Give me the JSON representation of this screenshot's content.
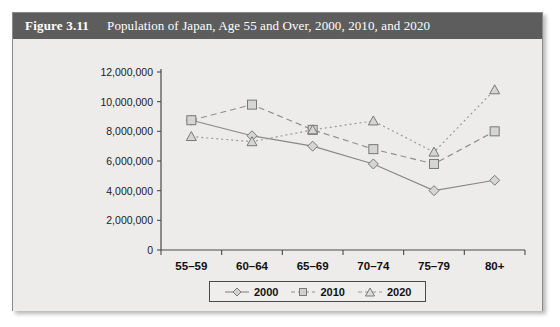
{
  "figure": {
    "number": "Figure 3.11",
    "title": "Population of Japan, Age 55 and Over, 2000, 2010, and 2020"
  },
  "chart_data": {
    "type": "line",
    "title": "Population of Japan, Age 55 and Over, 2000, 2010, and 2020",
    "xlabel": "",
    "ylabel": "",
    "categories": [
      "55–59",
      "60–64",
      "65–69",
      "70–74",
      "75–79",
      "80+"
    ],
    "ylim": [
      0,
      12000000
    ],
    "ytick_values": [
      0,
      2000000,
      4000000,
      6000000,
      8000000,
      10000000,
      12000000
    ],
    "ytick_labels": [
      "0",
      "2,000,000",
      "4,000,000",
      "6,000,000",
      "8,000,000",
      "10,000,000",
      "12,000,000"
    ],
    "grid": false,
    "legend_position": "bottom-center",
    "series": [
      {
        "name": "2000",
        "marker": "diamond",
        "line_style": "solid",
        "color": "#888888",
        "values": [
          8750000,
          7700000,
          7000000,
          5800000,
          4000000,
          4700000
        ]
      },
      {
        "name": "2010",
        "marker": "square",
        "line_style": "dashed",
        "color": "#8f8f8f",
        "values": [
          8750000,
          9800000,
          8100000,
          6800000,
          5800000,
          8000000
        ]
      },
      {
        "name": "2020",
        "marker": "triangle",
        "line_style": "dotted",
        "color": "#9a9a9a",
        "values": [
          7650000,
          7300000,
          8100000,
          8700000,
          6600000,
          10800000
        ]
      }
    ]
  },
  "colors": {
    "header_bg": "#5d5d5d",
    "panel_bg": "#edecea",
    "axis": "#4a4a4a",
    "series_2000": "#888888",
    "series_2010": "#8f8f8f",
    "series_2020": "#9a9a9a"
  }
}
